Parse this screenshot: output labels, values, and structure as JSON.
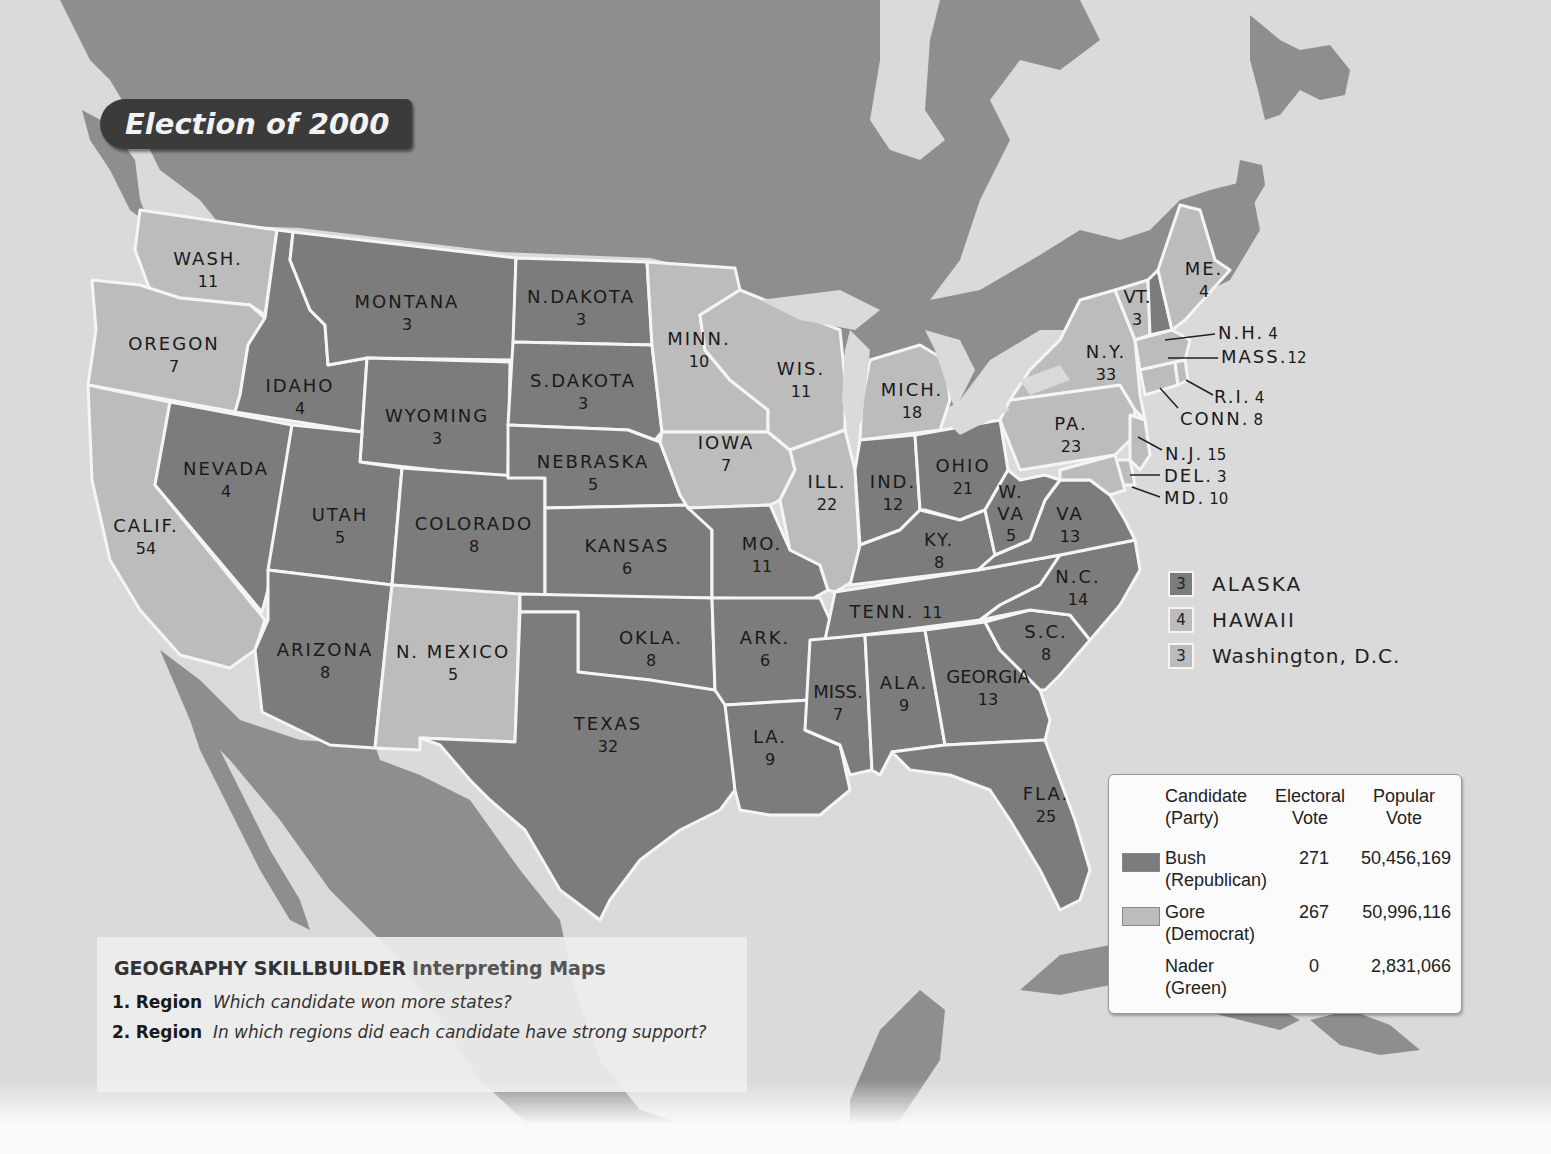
{
  "title": "Election of 2000",
  "colors": {
    "water": "#dadada",
    "foreign_land": "#8c8c8c",
    "bush_republican": "#7c7c7c",
    "gore_democrat": "#bcbcbc",
    "state_border": "#f5f5f5",
    "title_banner": "#3b3b3b"
  },
  "states": [
    {
      "name": "WASH.",
      "ev": "11",
      "winner": "gore"
    },
    {
      "name": "OREGON",
      "ev": "7",
      "winner": "gore"
    },
    {
      "name": "CALIF.",
      "ev": "54",
      "winner": "gore"
    },
    {
      "name": "IDAHO",
      "ev": "4",
      "winner": "bush"
    },
    {
      "name": "NEVADA",
      "ev": "4",
      "winner": "bush"
    },
    {
      "name": "MONTANA",
      "ev": "3",
      "winner": "bush"
    },
    {
      "name": "WYOMING",
      "ev": "3",
      "winner": "bush"
    },
    {
      "name": "UTAH",
      "ev": "5",
      "winner": "bush"
    },
    {
      "name": "COLORADO",
      "ev": "8",
      "winner": "bush"
    },
    {
      "name": "ARIZONA",
      "ev": "8",
      "winner": "bush"
    },
    {
      "name": "N. MEXICO",
      "ev": "5",
      "winner": "gore"
    },
    {
      "name": "N.DAKOTA",
      "ev": "3",
      "winner": "bush"
    },
    {
      "name": "S.DAKOTA",
      "ev": "3",
      "winner": "bush"
    },
    {
      "name": "NEBRASKA",
      "ev": "5",
      "winner": "bush"
    },
    {
      "name": "KANSAS",
      "ev": "6",
      "winner": "bush"
    },
    {
      "name": "OKLA.",
      "ev": "8",
      "winner": "bush"
    },
    {
      "name": "TEXAS",
      "ev": "32",
      "winner": "bush"
    },
    {
      "name": "MINN.",
      "ev": "10",
      "winner": "gore"
    },
    {
      "name": "IOWA",
      "ev": "7",
      "winner": "gore"
    },
    {
      "name": "MO.",
      "ev": "11",
      "winner": "bush"
    },
    {
      "name": "ARK.",
      "ev": "6",
      "winner": "bush"
    },
    {
      "name": "LA.",
      "ev": "9",
      "winner": "bush"
    },
    {
      "name": "WIS.",
      "ev": "11",
      "winner": "gore"
    },
    {
      "name": "ILL.",
      "ev": "22",
      "winner": "gore"
    },
    {
      "name": "MICH.",
      "ev": "18",
      "winner": "gore"
    },
    {
      "name": "IND.",
      "ev": "12",
      "winner": "bush"
    },
    {
      "name": "OHIO",
      "ev": "21",
      "winner": "bush"
    },
    {
      "name": "KY.",
      "ev": "8",
      "winner": "bush"
    },
    {
      "name": "TENN.",
      "ev": "11",
      "winner": "bush"
    },
    {
      "name": "MISS.",
      "ev": "7",
      "winner": "bush"
    },
    {
      "name": "ALA.",
      "ev": "9",
      "winner": "bush"
    },
    {
      "name": "GEORGIA",
      "ev": "13",
      "winner": "bush"
    },
    {
      "name": "FLA.",
      "ev": "25",
      "winner": "bush"
    },
    {
      "name": "S.C.",
      "ev": "8",
      "winner": "bush"
    },
    {
      "name": "N.C.",
      "ev": "14",
      "winner": "bush"
    },
    {
      "name": "VA",
      "ev": "13",
      "winner": "bush"
    },
    {
      "name": "W. VA",
      "ev": "5",
      "winner": "bush"
    },
    {
      "name": "PA.",
      "ev": "23",
      "winner": "gore"
    },
    {
      "name": "N.Y.",
      "ev": "33",
      "winner": "gore"
    },
    {
      "name": "VT.",
      "ev": "3",
      "winner": "gore"
    },
    {
      "name": "ME.",
      "ev": "4",
      "winner": "gore"
    }
  ],
  "callouts": [
    {
      "name": "N.H.",
      "ev": "4",
      "winner": "bush"
    },
    {
      "name": "MASS.",
      "ev": "12",
      "winner": "gore"
    },
    {
      "name": "R.I.",
      "ev": "4",
      "winner": "gore"
    },
    {
      "name": "CONN.",
      "ev": "8",
      "winner": "gore"
    },
    {
      "name": "N.J.",
      "ev": "15",
      "winner": "gore"
    },
    {
      "name": "DEL.",
      "ev": "3",
      "winner": "gore"
    },
    {
      "name": "MD.",
      "ev": "10",
      "winner": "gore"
    }
  ],
  "insets": [
    {
      "ev": "3",
      "name": "ALASKA",
      "winner": "bush"
    },
    {
      "ev": "4",
      "name": "HAWAII",
      "winner": "gore"
    },
    {
      "ev": "3",
      "name": "Washington, D.C.",
      "winner": "gore"
    }
  ],
  "legend": {
    "headers": {
      "candidate": "Candidate",
      "candidate_sub": "(Party)",
      "electoral": "Electoral",
      "electoral_sub": "Vote",
      "popular": "Popular",
      "popular_sub": "Vote"
    },
    "rows": [
      {
        "candidate": "Bush",
        "party": "(Republican)",
        "electoral": "271",
        "popular": "50,456,169",
        "swatch": "#7c7c7c"
      },
      {
        "candidate": "Gore",
        "party": "(Democrat)",
        "electoral": "267",
        "popular": "50,996,116",
        "swatch": "#bcbcbc"
      },
      {
        "candidate": "Nader",
        "party": "(Green)",
        "electoral": "0",
        "popular": "2,831,066",
        "swatch": ""
      }
    ]
  },
  "skillbuilder": {
    "heading_main": "GEOGRAPHY SKILLBUILDER",
    "heading_sub": "Interpreting Maps",
    "questions": [
      {
        "number": "1.",
        "label": "Region",
        "text": "Which candidate won more states?"
      },
      {
        "number": "2.",
        "label": "Region",
        "text": "In which regions did each candidate have strong support?"
      }
    ]
  }
}
